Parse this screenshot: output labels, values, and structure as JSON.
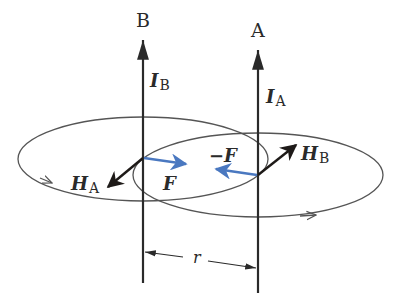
{
  "figure": {
    "wires": [
      {
        "id": "B",
        "label": "B",
        "current_symbol": "I",
        "current_subscript": "B",
        "x": 143
      },
      {
        "id": "A",
        "label": "A",
        "current_symbol": "I",
        "current_subscript": "A",
        "x": 258
      }
    ],
    "field_vectors": [
      {
        "symbol": "H",
        "subscript": "A",
        "direction": "down-left"
      },
      {
        "symbol": "H",
        "subscript": "B",
        "direction": "up-right"
      }
    ],
    "forces": [
      {
        "label": "F",
        "on_wire": "B",
        "direction": "toward A"
      },
      {
        "label": "−F",
        "on_wire": "A",
        "direction": "toward B"
      }
    ],
    "separation_label": "r",
    "colors": {
      "line": "#2a2a2a",
      "ellipse": "#555555",
      "force": "#4a78c0",
      "field": "#1e1a18"
    }
  }
}
